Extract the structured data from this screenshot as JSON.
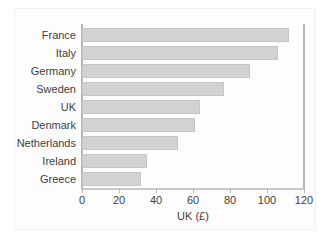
{
  "chart_data": {
    "type": "bar",
    "orientation": "horizontal",
    "title": "",
    "xlabel": "UK (£)",
    "ylabel": "",
    "xlim": [
      0,
      120
    ],
    "xticks": [
      0,
      20,
      40,
      60,
      80,
      100,
      120
    ],
    "grid": false,
    "legend": null,
    "bar_color": "#d2d2d2",
    "bar_edge_color": "#c6c6c6",
    "axis_color": "#b6b6b6",
    "text_color": "#3d3d3d",
    "background": "#ffffff",
    "categories": [
      "France",
      "Italy",
      "Germany",
      "Sweden",
      "UK",
      "Denmark",
      "Netherlands",
      "Ireland",
      "Greece"
    ],
    "values": [
      112,
      106,
      91,
      77,
      64,
      61,
      52,
      35,
      32
    ]
  }
}
